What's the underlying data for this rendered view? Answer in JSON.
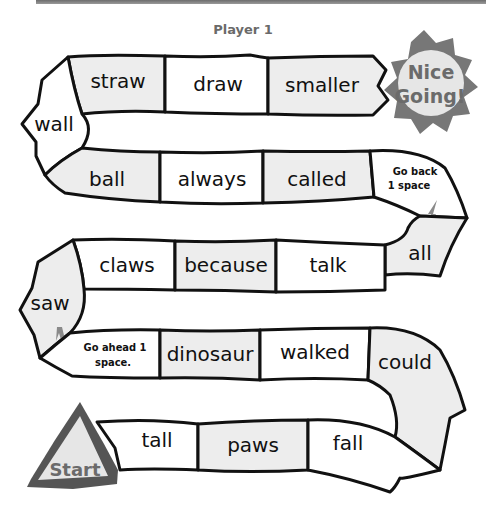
{
  "header": {
    "title": "Player 1"
  },
  "colors": {
    "shaded_cell": "#ededed",
    "plain_cell": "#ffffff",
    "outline": "#111111",
    "badge_gray": "#777777",
    "badge_inner": "#e6e6e6",
    "title_gray": "#6a6a6a"
  },
  "board": {
    "row1": [
      "straw",
      "draw",
      "smaller"
    ],
    "left_turn_1": "wall",
    "row2": [
      "ball",
      "always",
      "called"
    ],
    "right_turn_1_instruction": [
      "Go back",
      "1 space"
    ],
    "right_turn_1_word": "all",
    "row3": [
      "claws",
      "because",
      "talk"
    ],
    "left_turn_2": "saw",
    "row4_instruction": [
      "Go ahead 1",
      "space."
    ],
    "row4": [
      "dinosaur",
      "walked"
    ],
    "right_turn_2": "could",
    "row5": [
      "tall",
      "paws",
      "fall"
    ]
  },
  "badges": {
    "finish": [
      "Nice",
      "Going!"
    ],
    "start": "Start"
  },
  "icons": {
    "back_arrow": "arrow-down-icon",
    "ahead_arrow": "arrow-up-icon"
  }
}
